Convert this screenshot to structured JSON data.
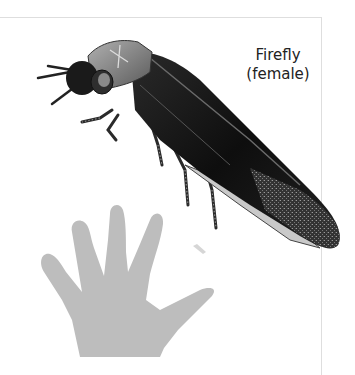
{
  "figure": {
    "label_line1": "Firefly",
    "label_line2": "(female)",
    "subjects": [
      "firefly-female",
      "human-hand"
    ],
    "colors": {
      "hand": "#bdbdbd",
      "beetle_body": "#151515",
      "beetle_pronotum": "#8a8a8a",
      "lantern": "#c9c9c9",
      "frame": "#dedede"
    }
  }
}
